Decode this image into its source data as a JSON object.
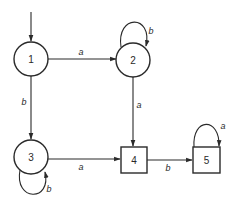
{
  "diagram": {
    "type": "state-machine",
    "start_state": "1",
    "nodes": [
      {
        "id": "1",
        "label": "1",
        "shape": "circle",
        "accepting": false
      },
      {
        "id": "2",
        "label": "2",
        "shape": "circle",
        "accepting": false
      },
      {
        "id": "3",
        "label": "3",
        "shape": "circle",
        "accepting": false
      },
      {
        "id": "4",
        "label": "4",
        "shape": "square",
        "accepting": true
      },
      {
        "id": "5",
        "label": "5",
        "shape": "square",
        "accepting": true
      }
    ],
    "edges": [
      {
        "from": "1",
        "to": "2",
        "label": "a"
      },
      {
        "from": "1",
        "to": "3",
        "label": "b"
      },
      {
        "from": "2",
        "to": "2",
        "label": "b"
      },
      {
        "from": "2",
        "to": "4",
        "label": "a"
      },
      {
        "from": "3",
        "to": "3",
        "label": "b"
      },
      {
        "from": "3",
        "to": "4",
        "label": "a"
      },
      {
        "from": "4",
        "to": "5",
        "label": "b"
      },
      {
        "from": "5",
        "to": "5",
        "label": "a"
      }
    ]
  }
}
